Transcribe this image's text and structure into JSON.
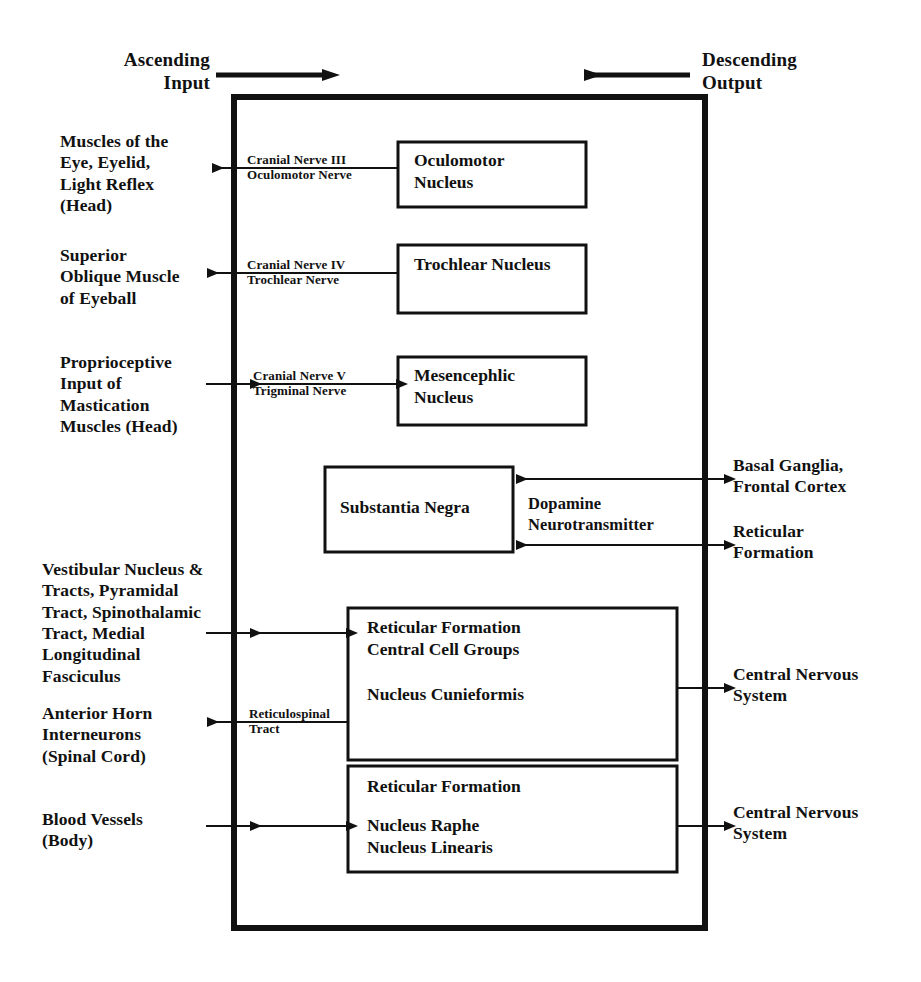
{
  "figure": {
    "ink_color": "#111111",
    "background_color": "#ffffff"
  },
  "flow_headings": {
    "ascending": "Ascending\nInput",
    "descending": "Descending\nOutput"
  },
  "nuclei_boxes": [
    {
      "id": "oculomotor",
      "label": "Oculomotor\nNucleus"
    },
    {
      "id": "trochlear",
      "label": "Trochlear Nucleus"
    },
    {
      "id": "mesencephalic",
      "label": "Mesencephlic\nNucleus"
    },
    {
      "id": "substantia-negra",
      "label": "Substantia Negra"
    },
    {
      "id": "reticular-central",
      "label": "Reticular Formation\nCentral Cell Groups"
    },
    {
      "id": "nucleus-cunieformis",
      "label": "Nucleus Cunieformis"
    },
    {
      "id": "reticular-raphe-head",
      "label": "Reticular Formation"
    },
    {
      "id": "reticular-raphe-body",
      "label": "Nucleus Raphe\nNucleus Linearis"
    }
  ],
  "left_labels": [
    {
      "id": "muscles-eye",
      "text": "Muscles of the\nEye, Eyelid,\nLight Reflex\n(Head)"
    },
    {
      "id": "superior-oblique",
      "text": "Superior\nOblique Muscle\nof Eyeball"
    },
    {
      "id": "proprioceptive",
      "text": "Proprioceptive\nInput of\nMastication\nMuscles (Head)"
    },
    {
      "id": "vestibular",
      "text": "Vestibular Nucleus &\nTracts, Pyramidal\nTract, Spinothalamic\nTract, Medial\nLongitudinal\nFasciculus"
    },
    {
      "id": "anterior-horn",
      "text": "Anterior Horn\nInterneurons\n(Spinal Cord)"
    },
    {
      "id": "blood-vessels",
      "text": "Blood Vessels\n(Body)"
    }
  ],
  "right_labels": [
    {
      "id": "basal-ganglia",
      "text": "Basal Ganglia,\nFrontal Cortex"
    },
    {
      "id": "reticular-formation-right",
      "text": "Reticular\nFormation"
    },
    {
      "id": "cns-upper",
      "text": "Central Nervous\nSystem"
    },
    {
      "id": "cns-lower",
      "text": "Central Nervous\nSystem"
    }
  ],
  "pathway_notes": [
    {
      "id": "cn3",
      "text": "Cranial Nerve III\nOculomotor Nerve"
    },
    {
      "id": "cn4",
      "text": "Cranial Nerve IV\nTrochlear Nerve"
    },
    {
      "id": "cn5",
      "text": "Cranial Nerve V\nTrigminal Nerve"
    },
    {
      "id": "dopamine",
      "text": "Dopamine\nNeurotransmitter"
    },
    {
      "id": "reticulospinal",
      "text": "Reticulospinal\nTract"
    }
  ],
  "geometry": {
    "outer_box": {
      "x": 234,
      "y": 97,
      "w": 471,
      "h": 831,
      "stroke": 6
    },
    "inner_stroke": 3,
    "line_stroke": 2
  }
}
